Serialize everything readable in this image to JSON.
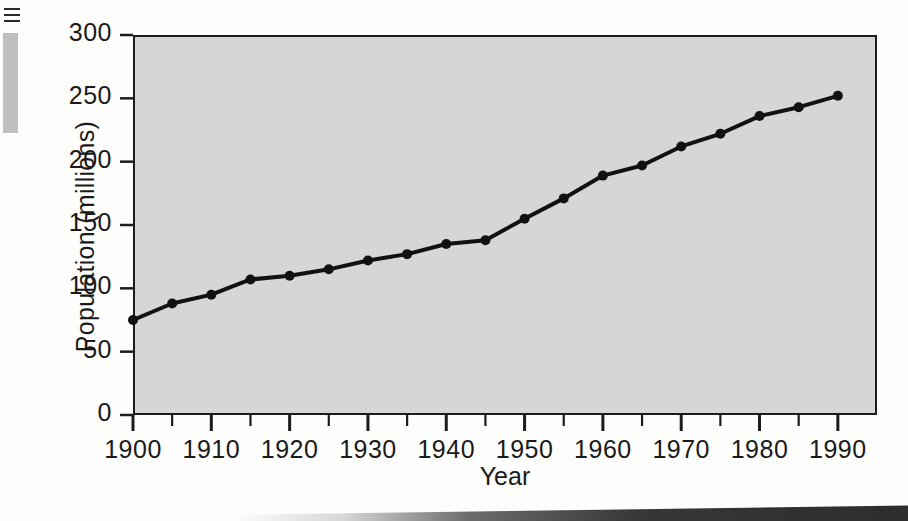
{
  "chart_data": {
    "type": "line",
    "title": "",
    "xlabel": "Year",
    "ylabel": "Population (millions)",
    "x": [
      1900,
      1905,
      1910,
      1915,
      1920,
      1925,
      1930,
      1935,
      1940,
      1945,
      1950,
      1955,
      1960,
      1965,
      1970,
      1975,
      1980,
      1985,
      1990
    ],
    "values": [
      75,
      88,
      95,
      107,
      110,
      115,
      122,
      127,
      135,
      138,
      155,
      171,
      189,
      197,
      212,
      222,
      236,
      243,
      252
    ],
    "series": [
      {
        "name": "Population",
        "values": [
          75,
          88,
          95,
          107,
          110,
          115,
          122,
          127,
          135,
          138,
          155,
          171,
          189,
          197,
          212,
          222,
          236,
          243,
          252
        ]
      }
    ],
    "xlim": [
      1900,
      1995
    ],
    "ylim": [
      0,
      300
    ],
    "y_ticks": [
      0,
      50,
      100,
      150,
      200,
      250,
      300
    ],
    "y_tick_labels": [
      "0",
      "50",
      "100",
      "150",
      "200",
      "250",
      "300"
    ],
    "x_major_ticks": [
      1900,
      1910,
      1920,
      1930,
      1940,
      1950,
      1960,
      1970,
      1980,
      1990
    ],
    "x_tick_labels": [
      "1900",
      "1910",
      "1920",
      "1930",
      "1940",
      "1950",
      "1960",
      "1970",
      "1980",
      "1990"
    ],
    "x_minor_tick_interval": 5,
    "grid": false,
    "legend": "none",
    "marker": "circle",
    "line_color": "#111111",
    "marker_color": "#111111",
    "plot_background_color": "#d6d6d6",
    "axis_color": "#1c1c1c",
    "page_background_color": "#fdfdfc"
  },
  "artifacts": {
    "page_edge_bar_color": "#b4b4b4",
    "bottom_shadow_color": "#2e2c2a"
  }
}
